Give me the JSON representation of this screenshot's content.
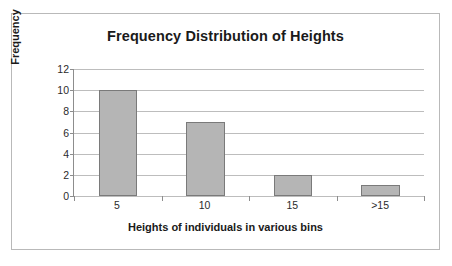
{
  "chart_data": {
    "type": "bar",
    "title": "Frequency Distribution of Heights",
    "xlabel": "Heights of individuals in various bins",
    "ylabel": "Frequency",
    "categories": [
      "5",
      "10",
      "15",
      ">15"
    ],
    "values": [
      10,
      7,
      2,
      1
    ],
    "yticks": [
      0,
      2,
      4,
      6,
      8,
      10,
      12
    ],
    "ylim": [
      0,
      12
    ],
    "grid": true,
    "legend": "none",
    "colors": {
      "bar_fill": "#b5b5b5",
      "bar_border": "#7a7a7a",
      "gridline": "#bdbdbd",
      "axis": "#8d8d8d",
      "frame_border": "#b9b9b9",
      "background": "#ffffff",
      "text": "#1a1a1a"
    }
  }
}
